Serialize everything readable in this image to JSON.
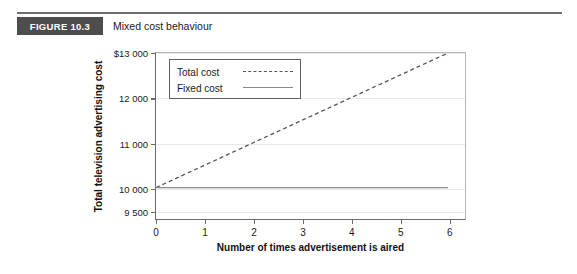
{
  "figure": {
    "label": "FIGURE 10.3",
    "caption": "Mixed cost behaviour",
    "label_bg": "#4d4d4d",
    "rule_color": "#6e6e6e"
  },
  "chart_data": {
    "type": "line",
    "title": "Mixed cost behaviour",
    "xlabel": "Number of times advertisement is aired",
    "ylabel": "Total television advertising cost",
    "x": [
      0,
      1,
      2,
      3,
      4,
      5,
      6
    ],
    "xlim": [
      0,
      6.35
    ],
    "xticks": [
      0,
      1,
      2,
      3,
      4,
      5,
      6
    ],
    "xticklabels": [
      "0",
      "1",
      "2",
      "3",
      "4",
      "5",
      "6"
    ],
    "ylim": [
      9300,
      13000
    ],
    "yticks": [
      9500,
      10000,
      11000,
      12000,
      13000
    ],
    "yticklabels": [
      "9 500",
      "10 000",
      "11 000",
      "12 000",
      "$13 000"
    ],
    "grid": true,
    "legend_position": "upper left",
    "series": [
      {
        "name": "Total cost",
        "style": "dashed",
        "color": "#555555",
        "values": [
          10000,
          10500,
          11000,
          11500,
          12000,
          12500,
          13000
        ]
      },
      {
        "name": "Fixed cost",
        "style": "solid",
        "color": "#8a8a8a",
        "values": [
          10000,
          10000,
          10000,
          10000,
          10000,
          10000,
          10000
        ]
      }
    ]
  },
  "legend": {
    "items": [
      {
        "label": "Total cost",
        "style": "dashed"
      },
      {
        "label": "Fixed cost",
        "style": "solid"
      }
    ]
  }
}
